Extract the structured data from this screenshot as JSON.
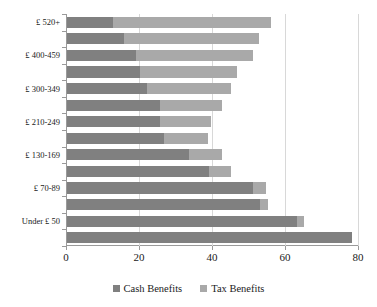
{
  "chart_data": {
    "type": "bar",
    "orientation": "horizontal",
    "stacked": true,
    "title": "",
    "subtitle": "",
    "xlabel": "",
    "ylabel": "",
    "xlim": [
      0,
      80
    ],
    "ylim": null,
    "xticks": [
      0,
      20,
      40,
      60,
      80
    ],
    "xtick_labels": [
      "0",
      "20",
      "40",
      "60",
      "80"
    ],
    "grid": "vertical",
    "legend_position": "bottom-center",
    "categories": [
      "£ 520+",
      "",
      "£ 400-459",
      "",
      "£ 300-349",
      "",
      "£ 210-249",
      "",
      "£ 130-169",
      "",
      "£ 70-89",
      "",
      "Under £ 50",
      ""
    ],
    "visible_category_labels": [
      "£ 520+",
      "£ 400-459",
      "£ 300-349",
      "£ 210-249",
      "£ 130-169",
      "£ 70-89",
      "Under £ 50"
    ],
    "series": [
      {
        "name": "Cash Benefits",
        "color": "#808080",
        "values": [
          12.5,
          15.5,
          19,
          20,
          22,
          25.5,
          25.5,
          26.5,
          33.5,
          39,
          51,
          53,
          63,
          78
        ]
      },
      {
        "name": "Tax Benefits",
        "color": "#a9a9a9",
        "values": [
          43.5,
          37,
          32,
          26.5,
          23,
          17,
          14,
          12,
          9,
          6,
          3.5,
          2,
          2,
          0
        ]
      }
    ],
    "totals": [
      56,
      52.5,
      51,
      46.5,
      45,
      42.5,
      39.5,
      38.5,
      42.5,
      45,
      54.5,
      55,
      65,
      78
    ],
    "legend": [
      {
        "label": "Cash Benefits",
        "color": "#808080"
      },
      {
        "label": "Tax Benefits",
        "color": "#a9a9a9"
      }
    ]
  },
  "axis": {
    "x_min_label": "0",
    "x_max_label": "80"
  },
  "colors": {
    "cash_benefits": "#808080",
    "tax_benefits": "#a9a9a9",
    "gridline": "#d8d8d8",
    "axis": "#9a9a9a",
    "background": "#ffffff",
    "text": "#1a1a1a"
  }
}
